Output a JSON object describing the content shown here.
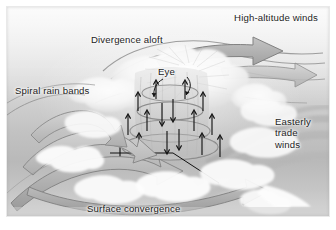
{
  "figure": {
    "palette": {
      "ink": "#1d1d1d",
      "arrow_fill": "#a8a8a8",
      "arrow_stroke": "#7d7d7d",
      "cloud": "#fbfbfb",
      "sky_top": "#f4f4f4",
      "sky_bottom": "#b9b9b9",
      "frame": "#ffffff"
    }
  },
  "labels": {
    "high_altitude_winds": "High-altitude winds",
    "divergence_aloft": "Divergence aloft",
    "spiral_rain_bands": "Spiral rain bands",
    "eye": "Eye",
    "easterly_trade_winds": "Easterly\ntrade\nwinds",
    "surface_convergence": "Surface convergence"
  },
  "icons": {
    "outflow_arrow": "outflow-arrow-icon",
    "inflow_arrow": "inflow-arrow-icon",
    "updraft_arrow": "updraft-arrow-icon",
    "subsidence_arrow": "subsidence-arrow-icon",
    "spiral_band": "spiral-band-icon",
    "eyewall_tower": "eyewall-tower-icon",
    "leader_line": "leader-line-icon"
  }
}
